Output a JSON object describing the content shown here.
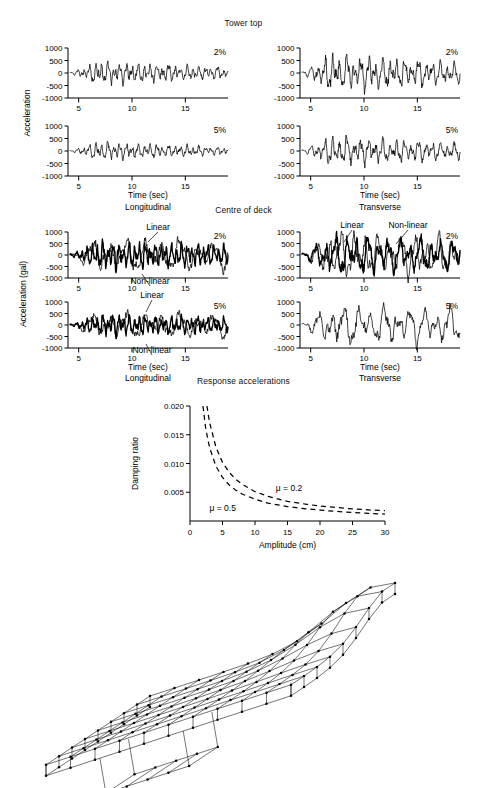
{
  "figure": {
    "sections": [
      {
        "id": "tower-top",
        "title": "Tower top"
      },
      {
        "id": "centre-of-deck",
        "title": "Centre of deck"
      },
      {
        "id": "response-accelerations",
        "title": "Response accelerations"
      }
    ]
  },
  "labels": {
    "acceleration": "Acceleration",
    "acceleration_gal": "Acceleration (gal)",
    "time_sec": "Time (sec)",
    "longitudinal": "Longitudinal",
    "transverse": "Transverse",
    "damping_ratio": "Damping ratio",
    "amplitude_cm": "Amplitude (cm)",
    "linear": "Linear",
    "nonlinear": "Non-linear",
    "damping_2": "2%",
    "damping_5": "5%",
    "mu_02": "μ = 0.2",
    "mu_05": "μ = 0.5"
  },
  "chart_data": [
    {
      "id": "tower-top-longitudinal-2pct",
      "type": "line",
      "title": "Tower top",
      "panel": "Longitudinal",
      "damping": "2%",
      "xlabel": "Time (sec)",
      "ylabel": "Acceleration",
      "xlim": [
        4,
        19
      ],
      "ylim": [
        -1000,
        1000
      ],
      "xticks": [
        5,
        10,
        15
      ],
      "yticks": [
        -1000,
        -500,
        0,
        500,
        1000
      ],
      "grid": false,
      "series": [
        {
          "name": "response",
          "style": "solid-thin"
        }
      ]
    },
    {
      "id": "tower-top-transverse-2pct",
      "type": "line",
      "title": "Tower top",
      "panel": "Transverse",
      "damping": "2%",
      "xlabel": "Time (sec)",
      "ylabel": "Acceleration",
      "xlim": [
        4,
        19
      ],
      "ylim": [
        -1000,
        1000
      ],
      "xticks": [
        5,
        10,
        15
      ],
      "yticks": [
        -1000,
        -500,
        0,
        500,
        1000
      ],
      "grid": false,
      "series": [
        {
          "name": "response",
          "style": "solid-thin"
        }
      ]
    },
    {
      "id": "tower-top-longitudinal-5pct",
      "type": "line",
      "title": "Tower top",
      "panel": "Longitudinal",
      "damping": "5%",
      "xlabel": "Time (sec)",
      "ylabel": "Acceleration",
      "xlim": [
        4,
        19
      ],
      "ylim": [
        -1000,
        1000
      ],
      "xticks": [
        5,
        10,
        15
      ],
      "yticks": [
        -1000,
        -500,
        0,
        500,
        1000
      ],
      "grid": false,
      "series": [
        {
          "name": "response",
          "style": "solid-thin"
        }
      ]
    },
    {
      "id": "tower-top-transverse-5pct",
      "type": "line",
      "title": "Tower top",
      "panel": "Transverse",
      "damping": "5%",
      "xlabel": "Time (sec)",
      "ylabel": "Acceleration",
      "xlim": [
        4,
        19
      ],
      "ylim": [
        -1000,
        1000
      ],
      "xticks": [
        5,
        10,
        15
      ],
      "yticks": [
        -1000,
        -500,
        0,
        500,
        1000
      ],
      "grid": false,
      "series": [
        {
          "name": "response",
          "style": "solid-thin"
        }
      ]
    },
    {
      "id": "deck-longitudinal-2pct",
      "type": "line",
      "title": "Centre of deck",
      "panel": "Longitudinal",
      "damping": "2%",
      "xlabel": "Time (sec)",
      "ylabel": "Acceleration (gal)",
      "xlim": [
        4,
        19
      ],
      "ylim": [
        -1000,
        1000
      ],
      "xticks": [
        5,
        10,
        15
      ],
      "yticks": [
        -1000,
        -500,
        0,
        500,
        1000
      ],
      "grid": false,
      "annotations": [
        "Linear",
        "Non-linear"
      ],
      "series": [
        {
          "name": "Linear",
          "style": "solid-thin"
        },
        {
          "name": "Non-linear",
          "style": "solid-thick"
        }
      ]
    },
    {
      "id": "deck-transverse-2pct",
      "type": "line",
      "title": "Centre of deck",
      "panel": "Transverse",
      "damping": "2%",
      "xlabel": "Time (sec)",
      "ylabel": "Acceleration (gal)",
      "xlim": [
        4,
        19
      ],
      "ylim": [
        -1000,
        1000
      ],
      "xticks": [
        5,
        10,
        15
      ],
      "yticks": [
        -1000,
        -500,
        0,
        500,
        1000
      ],
      "grid": false,
      "annotations": [
        "Linear",
        "Non-linear"
      ],
      "series": [
        {
          "name": "Linear",
          "style": "solid-thin"
        },
        {
          "name": "Non-linear",
          "style": "solid-thick"
        }
      ]
    },
    {
      "id": "deck-longitudinal-5pct",
      "type": "line",
      "title": "Centre of deck",
      "panel": "Longitudinal",
      "damping": "5%",
      "xlabel": "Time (sec)",
      "ylabel": "Acceleration (gal)",
      "xlim": [
        4,
        19
      ],
      "ylim": [
        -1000,
        1000
      ],
      "xticks": [
        5,
        10,
        15
      ],
      "yticks": [
        -1000,
        -500,
        0,
        500,
        1000
      ],
      "grid": false,
      "annotations": [
        "Linear",
        "Non-linear"
      ],
      "series": [
        {
          "name": "Linear",
          "style": "solid-thin"
        },
        {
          "name": "Non-linear",
          "style": "solid-thick"
        }
      ]
    },
    {
      "id": "deck-transverse-5pct",
      "type": "line",
      "title": "Centre of deck",
      "panel": "Transverse",
      "damping": "5%",
      "xlabel": "Time (sec)",
      "ylabel": "Acceleration (gal)",
      "xlim": [
        4,
        19
      ],
      "ylim": [
        -1000,
        1000
      ],
      "xticks": [
        5,
        10,
        15
      ],
      "yticks": [
        -1000,
        -500,
        0,
        500,
        1000
      ],
      "grid": false,
      "series": [
        {
          "name": "response",
          "style": "solid-thin"
        }
      ]
    },
    {
      "id": "damping-ratio-vs-amplitude",
      "type": "line",
      "title": "Response accelerations",
      "xlabel": "Amplitude (cm)",
      "ylabel": "Damping ratio",
      "xlim": [
        0,
        30
      ],
      "ylim": [
        0,
        0.02
      ],
      "xticks": [
        0,
        5,
        10,
        15,
        20,
        25,
        30
      ],
      "yticks": [
        0.005,
        0.01,
        0.015,
        0.02
      ],
      "ytick_labels": [
        "0.005",
        "0.010",
        "0.015",
        "0.020"
      ],
      "grid": false,
      "linestyle": "dashed",
      "series": [
        {
          "name": "μ = 0.2",
          "x": [
            2.6,
            3,
            4,
            5,
            6,
            7,
            8,
            10,
            12,
            15,
            18,
            20,
            22,
            25,
            28,
            30
          ],
          "y": [
            0.02,
            0.0172,
            0.0128,
            0.0102,
            0.0085,
            0.0073,
            0.0064,
            0.0051,
            0.0043,
            0.0034,
            0.0029,
            0.0026,
            0.0024,
            0.0021,
            0.0019,
            0.0018
          ]
        },
        {
          "name": "μ = 0.5",
          "x": [
            2.0,
            2.4,
            3,
            4,
            5,
            6,
            7,
            8,
            10,
            12,
            15,
            18,
            20,
            22,
            25,
            28,
            30
          ],
          "y": [
            0.02,
            0.0162,
            0.0128,
            0.0095,
            0.0076,
            0.0063,
            0.0054,
            0.0047,
            0.0038,
            0.0031,
            0.0025,
            0.0021,
            0.0019,
            0.0017,
            0.0015,
            0.0013,
            0.0012
          ]
        }
      ]
    }
  ],
  "mesh": {
    "name": "deck-finite-element-mesh",
    "description": "3D finite element mesh of bridge deck with box girder",
    "rows": 9,
    "cols": 11
  }
}
